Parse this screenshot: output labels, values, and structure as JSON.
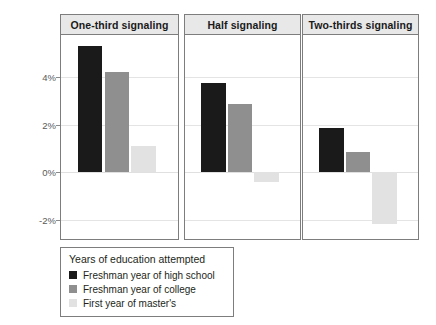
{
  "chart_data": {
    "type": "bar",
    "title": "",
    "xlabel": "",
    "ylabel": "Degree return",
    "ylim": [
      -3.2,
      6.3
    ],
    "grid": true,
    "grid_axis": "y",
    "legend_position": "bottom-left",
    "legend_title": "Years of education attempted",
    "yticks": [
      {
        "value": 4,
        "label": "4%"
      },
      {
        "value": 2,
        "label": "2%"
      },
      {
        "value": 0,
        "label": "0%"
      },
      {
        "value": -2,
        "label": "-2%"
      }
    ],
    "facets": [
      "One-third signaling",
      "Half signaling",
      "Two-thirds signaling"
    ],
    "categories": [
      "Freshman year of high school",
      "Freshman year of college",
      "First year of master's"
    ],
    "series": [
      {
        "name": "Freshman year of high school",
        "color": "#1a1a1a",
        "values": [
          5.3,
          3.75,
          1.85
        ]
      },
      {
        "name": "Freshman year of college",
        "color": "#8f8f8f",
        "values": [
          4.2,
          2.85,
          0.85
        ]
      },
      {
        "name": "First year of master's",
        "color": "#e2e2e2",
        "values": [
          1.1,
          -0.4,
          -2.2
        ]
      }
    ],
    "panels": [
      {
        "label": "One-third signaling",
        "bars": [
          {
            "series": "Freshman year of high school",
            "value": 5.3
          },
          {
            "series": "Freshman year of college",
            "value": 4.2
          },
          {
            "series": "First year of master's",
            "value": 1.1
          }
        ]
      },
      {
        "label": "Half signaling",
        "bars": [
          {
            "series": "Freshman year of high school",
            "value": 3.75
          },
          {
            "series": "Freshman year of college",
            "value": 2.85
          },
          {
            "series": "First year of master's",
            "value": -0.4
          }
        ]
      },
      {
        "label": "Two-thirds signaling",
        "bars": [
          {
            "series": "Freshman year of high school",
            "value": 1.85
          },
          {
            "series": "Freshman year of college",
            "value": 0.85
          },
          {
            "series": "First year of master's",
            "value": -2.2
          }
        ]
      }
    ]
  },
  "axis": {
    "y_title": "Degree return",
    "ticks": [
      "4%",
      "2%",
      "0%",
      "-2%"
    ]
  },
  "panels": {
    "p1_header": "One-third signaling",
    "p2_header": "Half signaling",
    "p3_header": "Two-thirds signaling"
  },
  "legend": {
    "title": "Years of education attempted",
    "items": [
      {
        "label": "Freshman year of high school",
        "color": "#1a1a1a"
      },
      {
        "label": "Freshman year of college",
        "color": "#8f8f8f"
      },
      {
        "label": "First year of master's",
        "color": "#e2e2e2"
      }
    ]
  },
  "colors": {
    "panel_strip_bg": "#e8e8e8",
    "panel_border": "#7d7d7d",
    "gridline": "#e4e4e4",
    "text": "#231f20",
    "tick_text": "#5a5a5a"
  }
}
